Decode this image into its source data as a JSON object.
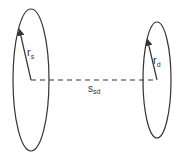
{
  "diagram": {
    "source": {
      "radius_label": "r",
      "radius_subscript": "s",
      "center": [
        31,
        80
      ],
      "rx": 18,
      "ry": 71
    },
    "destination": {
      "radius_label": "r",
      "radius_subscript": "d",
      "center": [
        157,
        80
      ],
      "rx": 14,
      "ry": 58
    },
    "separation": {
      "label": "s",
      "subscript": "sd"
    },
    "colors": {
      "stroke": "#333333",
      "background": "#ffffff"
    }
  }
}
